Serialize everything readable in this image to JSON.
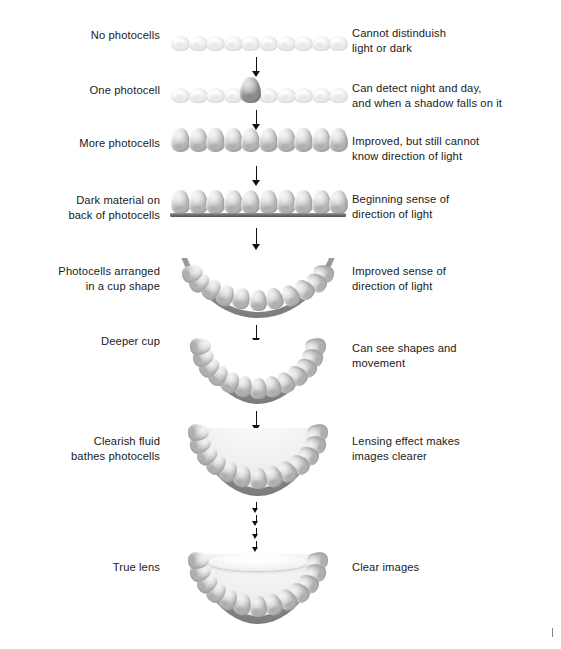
{
  "diagram": {
    "background_color": "#ffffff",
    "text_color": "#1a1a1a",
    "corner_mark": "tick-mark"
  },
  "stages": [
    {
      "id": "no-photocells",
      "left_label_line1": "No photocells",
      "left_label_line2": "",
      "right_label_line1": "Cannot distinduish",
      "right_label_line2": "light or dark",
      "illustration": "flat-pale-photocell-row",
      "cell_count": 10
    },
    {
      "id": "one-photocell",
      "left_label_line1": "One photocell",
      "left_label_line2": "",
      "right_label_line1": "Can detect night and day,",
      "right_label_line2": "and when a shadow falls on it",
      "illustration": "pale-row-with-one-raised-photocell",
      "cell_count": 10,
      "highlighted_index": 5
    },
    {
      "id": "more-photocells",
      "left_label_line1": "More photocells",
      "left_label_line2": "",
      "right_label_line1": "Improved, but still cannot",
      "right_label_line2": "know direction of light",
      "illustration": "cone-photocell-row",
      "cell_count": 10
    },
    {
      "id": "dark-material",
      "left_label_line1": "Dark material on",
      "left_label_line2": "back of photocells",
      "right_label_line1": "Beginning sense of",
      "right_label_line2": "direction of light",
      "illustration": "cone-row-with-dark-backing-bar",
      "cell_count": 10
    },
    {
      "id": "cup-shape",
      "left_label_line1": "Photocells arranged",
      "left_label_line2": "in a cup shape",
      "right_label_line1": "Improved sense of",
      "right_label_line2": "direction of light",
      "illustration": "shallow-cup",
      "cell_count": 11
    },
    {
      "id": "deeper-cup",
      "left_label_line1": "Deeper cup",
      "left_label_line2": "",
      "right_label_line1": "Can see shapes and",
      "right_label_line2": "movement",
      "illustration": "deep-cup",
      "cell_count": 13
    },
    {
      "id": "clearish-fluid",
      "left_label_line1": "Clearish fluid",
      "left_label_line2": "bathes photocells",
      "right_label_line1": "Lensing effect makes",
      "right_label_line2": "images clearer",
      "illustration": "fluid-filled-cup",
      "cell_count": 13
    },
    {
      "id": "true-lens",
      "left_label_line1": "True lens",
      "left_label_line2": "",
      "right_label_line1": "Clear images",
      "right_label_line2": "",
      "illustration": "cup-with-true-lens",
      "cell_count": 13
    }
  ]
}
